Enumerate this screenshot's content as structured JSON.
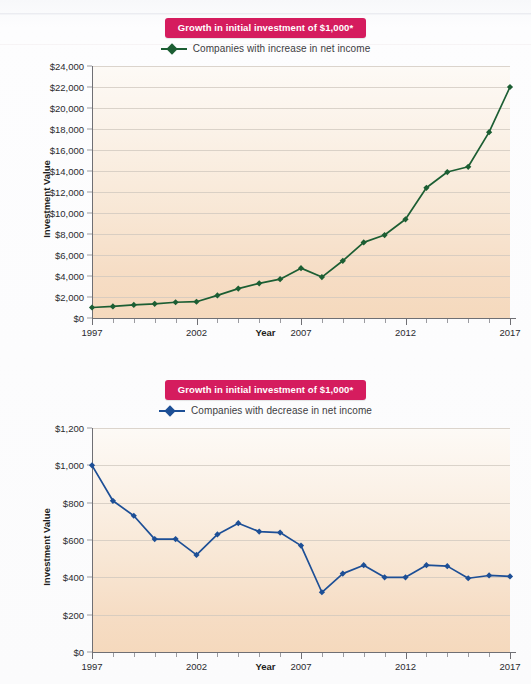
{
  "figure": {
    "background_color": "#fbfbfc",
    "banner_color": "#d51c5e",
    "plot_bg_top": "#fdfaf6",
    "plot_bg_bottom": "#f5d9bd"
  },
  "chart_data": [
    {
      "type": "line",
      "id": "increase-chart",
      "title": "Growth in initial investment of $1,000*",
      "xlabel": "Year",
      "ylabel": "Investment Value",
      "legend": [
        {
          "name": "Companies with increase in net income",
          "color": "#1c5e33"
        }
      ],
      "legend_position": "top-center",
      "grid": true,
      "xlim": [
        1997,
        2017
      ],
      "ylim": [
        0,
        24000
      ],
      "ytick_values": [
        0,
        2000,
        4000,
        6000,
        8000,
        10000,
        12000,
        14000,
        16000,
        18000,
        20000,
        22000,
        24000
      ],
      "ytick_labels": [
        "$0",
        "$2,000",
        "$4,000",
        "$6,000",
        "$8,000",
        "$10,000",
        "$12,000",
        "$14,000",
        "$16,000",
        "$18,000",
        "$20,000",
        "$22,000",
        "$24,000"
      ],
      "xtick_values": [
        1997,
        2002,
        2007,
        2012,
        2017
      ],
      "xtick_labels": [
        "1997",
        "2002",
        "2007",
        "2012",
        "2017"
      ],
      "x": [
        1997,
        1998,
        1999,
        2000,
        2001,
        2002,
        2003,
        2004,
        2005,
        2006,
        2007,
        2008,
        2009,
        2010,
        2011,
        2012,
        2013,
        2014,
        2015,
        2016,
        2017
      ],
      "values": [
        1000,
        1100,
        1250,
        1350,
        1500,
        1550,
        2150,
        2800,
        3300,
        3700,
        4750,
        3900,
        5450,
        7200,
        7900,
        9400,
        12400,
        13900,
        14400,
        17700,
        22000
      ]
    },
    {
      "type": "line",
      "id": "decrease-chart",
      "title": "Growth in initial investment of $1,000*",
      "xlabel": "Year",
      "ylabel": "Investment Value",
      "legend": [
        {
          "name": "Companies with decrease in net income",
          "color": "#1d4f96"
        }
      ],
      "legend_position": "top-center",
      "grid": true,
      "xlim": [
        1997,
        2017
      ],
      "ylim": [
        0,
        1200
      ],
      "ytick_values": [
        0,
        200,
        400,
        600,
        800,
        1000,
        1200
      ],
      "ytick_labels": [
        "$0",
        "$200",
        "$400",
        "$600",
        "$800",
        "$1,000",
        "$1,200"
      ],
      "xtick_values": [
        1997,
        2002,
        2007,
        2012,
        2017
      ],
      "xtick_labels": [
        "1997",
        "2002",
        "2007",
        "2012",
        "2017"
      ],
      "x": [
        1997,
        1998,
        1999,
        2000,
        2001,
        2002,
        2003,
        2004,
        2005,
        2006,
        2007,
        2008,
        2009,
        2010,
        2011,
        2012,
        2013,
        2014,
        2015,
        2016,
        2017
      ],
      "values": [
        1000,
        810,
        730,
        605,
        605,
        520,
        630,
        690,
        645,
        640,
        570,
        320,
        420,
        465,
        400,
        400,
        465,
        460,
        395,
        410,
        405
      ]
    }
  ]
}
